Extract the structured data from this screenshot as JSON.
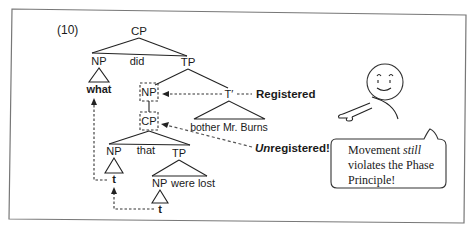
{
  "example_number": "(10)",
  "tree": {
    "root": "CP",
    "np_wh": "NP",
    "wh_word": "what",
    "aux": "did",
    "tp_main": "TP",
    "np_spec": "NP",
    "t_bar": "T′",
    "vp_text": "bother Mr. Burns",
    "cp_embedded": "CP",
    "np_embedded": "NP",
    "comp": "that",
    "tp_embedded": "TP",
    "trace_upper": "t",
    "np_lower": "NP",
    "were_lost": "were lost",
    "trace_lower": "t"
  },
  "annotations": {
    "registered": "Registered",
    "unregistered_prefix": "Un",
    "unregistered_rest": "registered!"
  },
  "speech_bubble": {
    "line1_a": "Movement ",
    "line1_b": "still",
    "line2": "violates the Phase",
    "line3": "Principle!"
  }
}
